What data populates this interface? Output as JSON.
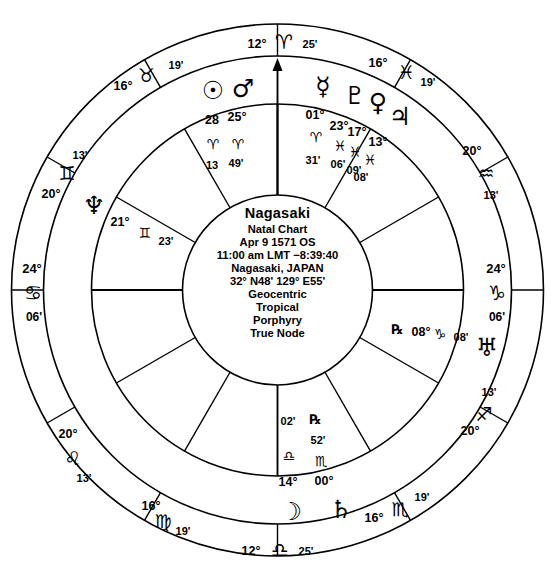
{
  "chart_data": {
    "type": "wheel",
    "title": "Nagasaki Natal Chart",
    "house_system": "Porphyry",
    "zodiac": "Tropical",
    "coordinate_system": "Geocentric",
    "node_type": "True Node",
    "cusps": [
      {
        "id": "mc",
        "label": "MC",
        "deg": "12°",
        "sign": "♈",
        "sign_name": "Aries",
        "min": "25'",
        "angle_deg": 90
      },
      {
        "id": "c11",
        "label": "11",
        "deg": "16°",
        "sign": "♓",
        "sign_name": "Pisces",
        "min": "19'",
        "angle_deg": 60
      },
      {
        "id": "c12",
        "label": "12",
        "deg": "20°",
        "sign": "♒",
        "sign_name": "Aquarius",
        "min": "13'",
        "angle_deg": 30
      },
      {
        "id": "dc",
        "label": "DC",
        "deg": "24°",
        "sign": "♑",
        "sign_name": "Capricorn",
        "min": "06'",
        "angle_deg": 0
      },
      {
        "id": "c2",
        "label": "2",
        "deg": "20°",
        "sign": "♐",
        "sign_name": "Sagittarius",
        "min": "13'",
        "angle_deg": 330
      },
      {
        "id": "c3",
        "label": "3",
        "deg": "16°",
        "sign": "♏",
        "sign_name": "Scorpio",
        "min": "19'",
        "angle_deg": 300
      },
      {
        "id": "ic",
        "label": "IC",
        "deg": "12°",
        "sign": "♎",
        "sign_name": "Libra",
        "min": "25'",
        "angle_deg": 270
      },
      {
        "id": "c5",
        "label": "5",
        "deg": "16°",
        "sign": "♍",
        "sign_name": "Virgo",
        "min": "19'",
        "angle_deg": 240
      },
      {
        "id": "c6",
        "label": "6",
        "deg": "20°",
        "sign": "♌",
        "sign_name": "Leo",
        "min": "13'",
        "angle_deg": 210
      },
      {
        "id": "asc",
        "label": "ASC",
        "deg": "24°",
        "sign": "♋",
        "sign_name": "Cancer",
        "min": "06'",
        "angle_deg": 180
      },
      {
        "id": "c8",
        "label": "8",
        "deg": "20°",
        "sign": "♊",
        "sign_name": "Gemini",
        "min": "13'",
        "angle_deg": 150
      },
      {
        "id": "c9",
        "label": "9",
        "deg": "16°",
        "sign": "♉",
        "sign_name": "Taurus",
        "min": "19'",
        "angle_deg": 120
      }
    ],
    "planets": [
      {
        "id": "sun",
        "name": "Sun",
        "glyph": "☉",
        "deg": "28",
        "sign": "♈",
        "sign_name": "Aries",
        "min": "13",
        "retrograde": false
      },
      {
        "id": "mars",
        "name": "Mars",
        "glyph": "♂",
        "deg": "25°",
        "sign": "♈",
        "sign_name": "Aries",
        "min": "49'",
        "retrograde": false
      },
      {
        "id": "mercury",
        "name": "Mercury",
        "glyph": "☿",
        "deg": "01°",
        "sign": "♈",
        "sign_name": "Aries",
        "min": "31'",
        "retrograde": false
      },
      {
        "id": "pluto",
        "name": "Pluto",
        "glyph": "♇",
        "deg": "23°",
        "sign": "♓",
        "sign_name": "Pisces",
        "min": "06'",
        "retrograde": false
      },
      {
        "id": "venus",
        "name": "Venus",
        "glyph": "♀",
        "deg": "17°",
        "sign": "♓",
        "sign_name": "Pisces",
        "min": "09'",
        "retrograde": false
      },
      {
        "id": "jupiter",
        "name": "Jupiter",
        "glyph": "♃",
        "deg": "13°",
        "sign": "♓",
        "sign_name": "Pisces",
        "min": "08'",
        "retrograde": false
      },
      {
        "id": "uranus",
        "name": "Uranus",
        "glyph": "♅",
        "deg": "08°",
        "sign": "♑",
        "sign_name": "Capricorn",
        "min": "08'",
        "retrograde": true
      },
      {
        "id": "saturn",
        "name": "Saturn",
        "glyph": "♄",
        "deg": "00°",
        "sign": "♏",
        "sign_name": "Scorpio",
        "min": "52'",
        "retrograde": true
      },
      {
        "id": "moon",
        "name": "Moon",
        "glyph": "☽",
        "deg": "14°",
        "sign": "♎",
        "sign_name": "Libra",
        "min": "02'",
        "retrograde": false
      },
      {
        "id": "neptune",
        "name": "Neptune",
        "glyph": "♆",
        "deg": "21°",
        "sign": "♊",
        "sign_name": "Gemini",
        "min": "23'",
        "retrograde": false
      }
    ]
  },
  "center": {
    "title": "Nagasaki",
    "line1": "Natal Chart",
    "line2": "Apr 9 1571 OS",
    "line3": "11:00 am  LMT −8:39:40",
    "line4": "Nagasaki, JAPAN",
    "line5": "32°  N48'  129°  E55'",
    "line6": "Geocentric",
    "line7": "Tropical",
    "line8": "Porphyry",
    "line9": "True Node"
  },
  "cusp_labels": {
    "mc": {
      "deg": "12°",
      "sign": "♈",
      "min": "25'"
    },
    "c11": {
      "deg": "16°",
      "sign": "♓",
      "min": "19'"
    },
    "c12": {
      "deg": "20°",
      "sign": "♒",
      "min": "13'"
    },
    "dc": {
      "deg": "24°",
      "sign": "♑",
      "min": "06'"
    },
    "c2": {
      "deg": "20°",
      "sign": "♐",
      "min": "13'"
    },
    "c3": {
      "deg": "16°",
      "sign": "♏",
      "min": "19'"
    },
    "ic": {
      "deg": "12°",
      "sign": "♎",
      "min": "25'"
    },
    "c5": {
      "deg": "16°",
      "sign": "♍",
      "min": "19'"
    },
    "c6": {
      "deg": "20°",
      "sign": "♌",
      "min": "13'"
    },
    "asc": {
      "deg": "24°",
      "sign": "♋",
      "min": "06'"
    },
    "c8": {
      "deg": "20°",
      "sign": "♊",
      "min": "13'"
    },
    "c9": {
      "deg": "16°",
      "sign": "♉",
      "min": "19'"
    }
  },
  "planet_labels": {
    "sun": {
      "glyph": "☉",
      "deg": "28",
      "sign": "♈",
      "min": "13"
    },
    "mars": {
      "glyph": "♂",
      "deg": "25°",
      "sign": "♈",
      "min": "49'"
    },
    "mercury": {
      "glyph": "☿",
      "deg": "01°",
      "sign": "♈",
      "min": "31'"
    },
    "pluto": {
      "glyph": "♇",
      "deg": "23°",
      "sign": "♓",
      "min": "06'"
    },
    "venus": {
      "glyph": "♀",
      "deg": "17°",
      "sign": "♓",
      "min": "09'"
    },
    "jupiter": {
      "glyph": "♃",
      "deg": "13°",
      "sign": "♓",
      "min": "08'"
    },
    "uranus": {
      "glyph": "♅",
      "deg": "08°",
      "sign": "♑",
      "min": "08'",
      "retro": "℞"
    },
    "saturn": {
      "glyph": "♄",
      "deg": "00°",
      "sign": "♏",
      "min": "52'",
      "retro": "℞"
    },
    "moon": {
      "glyph": "☽",
      "deg": "14°",
      "sign": "♎",
      "min": "02'"
    },
    "neptune": {
      "glyph": "♆",
      "deg": "21°",
      "sign": "♊",
      "min": "23'"
    }
  },
  "colors": {
    "ink": "#000000",
    "paper": "#ffffff"
  }
}
